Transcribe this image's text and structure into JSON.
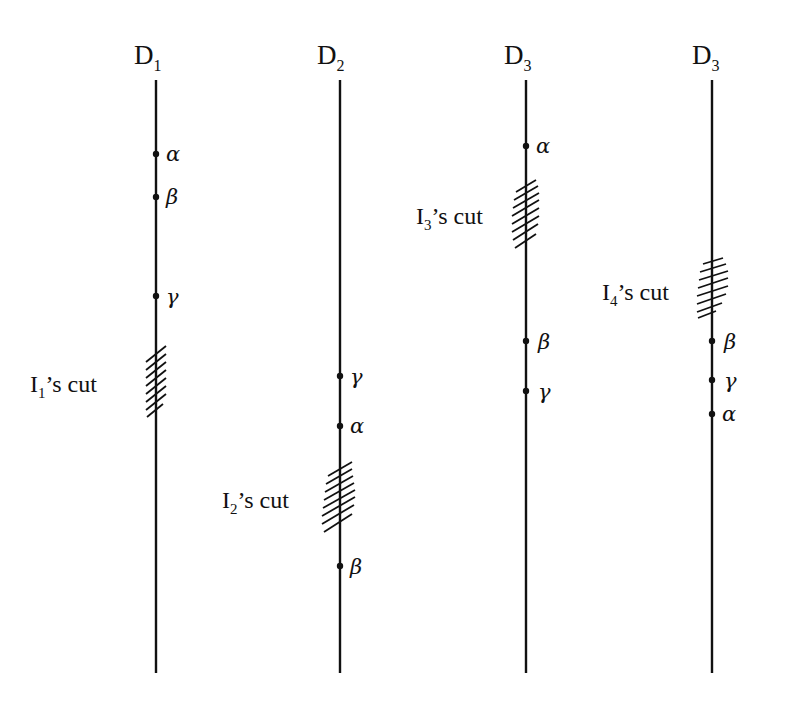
{
  "diagram": {
    "lines": [
      {
        "id": "line-1",
        "label": "D",
        "subscript": "1",
        "x": 156,
        "top": 80,
        "bottom": 673,
        "points": [
          {
            "label": "α",
            "y": 154
          },
          {
            "label": "β",
            "y": 197
          },
          {
            "label": "γ",
            "y": 296
          }
        ],
        "cut": {
          "label": "I",
          "subscript": "1",
          "suffix": "’s cut",
          "y_top": 346,
          "y_bottom": 416
        }
      },
      {
        "id": "line-2",
        "label": "D",
        "subscript": "2",
        "x": 340,
        "top": 80,
        "bottom": 673,
        "points": [
          {
            "label": "γ",
            "y": 376
          },
          {
            "label": "α",
            "y": 426
          },
          {
            "label": "β",
            "y": 566
          }
        ],
        "cut": {
          "label": "I",
          "subscript": "2",
          "suffix": "’s cut",
          "y_top": 462,
          "y_bottom": 534
        }
      },
      {
        "id": "line-3",
        "label": "D",
        "subscript": "3",
        "x": 526,
        "top": 80,
        "bottom": 673,
        "points": [
          {
            "label": "α",
            "y": 146
          },
          {
            "label": "β",
            "y": 341
          },
          {
            "label": "γ",
            "y": 391
          }
        ],
        "cut": {
          "label": "I",
          "subscript": "3",
          "suffix": "’s cut",
          "y_top": 180,
          "y_bottom": 250
        }
      },
      {
        "id": "line-4",
        "label": "D",
        "subscript": "3",
        "x": 712,
        "top": 80,
        "bottom": 673,
        "points": [
          {
            "label": "β",
            "y": 341
          },
          {
            "label": "γ",
            "y": 380
          },
          {
            "label": "α",
            "y": 414
          }
        ],
        "cut": {
          "label": "I",
          "subscript": "4",
          "suffix": "’s cut",
          "y_top": 256,
          "y_bottom": 316
        }
      }
    ]
  }
}
